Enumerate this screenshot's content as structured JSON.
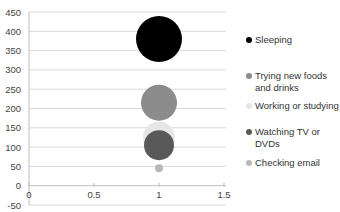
{
  "chart_data": {
    "type": "scatter",
    "subtype": "bubble",
    "title": "",
    "xlabel": "",
    "ylabel": "",
    "xlim": [
      0,
      1.5
    ],
    "ylim": [
      -50,
      450
    ],
    "x_ticks": [
      "0",
      "0.5",
      "1",
      "1.5"
    ],
    "y_ticks": [
      "450",
      "400",
      "350",
      "300",
      "250",
      "200",
      "150",
      "100",
      "50",
      "0",
      "-50"
    ],
    "grid": true,
    "legend_position": "right",
    "series": [
      {
        "name": "Sleeping",
        "x": 1,
        "y": 380,
        "size": 23,
        "color": "#000000"
      },
      {
        "name": "Trying new foods and drinks",
        "x": 1,
        "y": 215,
        "size": 18,
        "color": "#8c8c8c"
      },
      {
        "name": "Working or studying",
        "x": 1,
        "y": 125,
        "size": 16,
        "color": "#e6e6e6"
      },
      {
        "name": "Watching TV or DVDs",
        "x": 1,
        "y": 105,
        "size": 15,
        "color": "#595959"
      },
      {
        "name": "Checking email",
        "x": 1,
        "y": 45,
        "size": 4,
        "color": "#b8b8b8"
      }
    ]
  },
  "legend": {
    "items": [
      {
        "label": "Sleeping",
        "color": "#000000"
      },
      {
        "label": "Trying new foods and drinks",
        "color": "#8c8c8c"
      },
      {
        "label": "Working or studying",
        "color": "#e6e6e6"
      },
      {
        "label": "Watching TV or DVDs",
        "color": "#595959"
      },
      {
        "label": "Checking email",
        "color": "#b8b8b8"
      }
    ]
  }
}
